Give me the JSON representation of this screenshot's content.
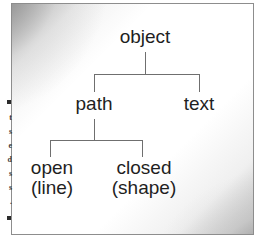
{
  "figure": {
    "kind": "hierarchy-tree-diagram",
    "root": {
      "label": "object",
      "children": [
        {
          "label": "path",
          "children": [
            {
              "label": "open",
              "sublabel": "(line)"
            },
            {
              "label": "closed",
              "sublabel": "(shape)"
            }
          ]
        },
        {
          "label": "text",
          "children": []
        }
      ]
    },
    "nodes": {
      "root": "object",
      "path": "path",
      "text": "text",
      "open": "open",
      "open_sub": "(line)",
      "closed": "closed",
      "closed_sub": "(shape)"
    },
    "colors": {
      "text": "#1f1f1f",
      "connector": "#6f6f6f",
      "border": "#8d8d8d",
      "panel_background": "#ffffff",
      "wash_gray": "#787878"
    }
  },
  "left_bleed": {
    "description": "cropped fragments of adjacent body-text column",
    "lines": [
      "t",
      "s",
      "e",
      "d",
      "s",
      "s",
      "."
    ],
    "bullet_glyph": "square-bullet"
  }
}
